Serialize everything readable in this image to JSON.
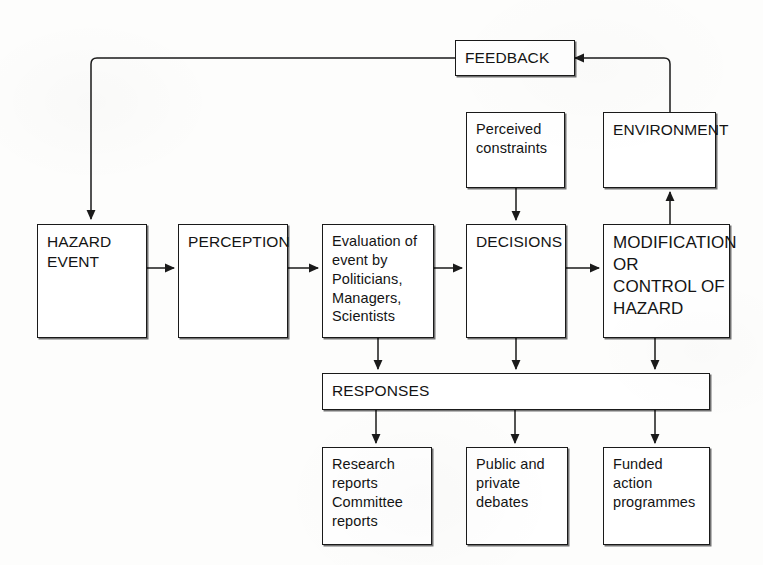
{
  "diagram": {
    "line_color": "#1a1a1a",
    "background_color": "#fdfdfc",
    "nodes": {
      "feedback": {
        "label": "FEEDBACK"
      },
      "environment": {
        "label": "ENVIRONMENT"
      },
      "constraints": {
        "label": "Perceived\nconstraints"
      },
      "hazard_event": {
        "label": "HAZARD\nEVENT"
      },
      "perception": {
        "label": "PERCEPTION"
      },
      "evaluation": {
        "label": "Evaluation of\nevent by\nPoliticians,\nManagers,\nScientists"
      },
      "decisions": {
        "label": "DECISIONS"
      },
      "modification": {
        "label": "MODIFICATION\nOR\nCONTROL OF\nHAZARD"
      },
      "responses": {
        "label": "RESPONSES"
      },
      "research": {
        "label": "Research\nreports\nCommittee\nreports"
      },
      "debates": {
        "label": "Public and\nprivate debates"
      },
      "funded": {
        "label": "Funded\naction\nprogrammes"
      }
    },
    "edges": [
      {
        "name": "hazard-to-perception",
        "from": "hazard_event",
        "to": "perception"
      },
      {
        "name": "perception-to-evaluation",
        "from": "perception",
        "to": "evaluation"
      },
      {
        "name": "evaluation-to-decisions",
        "from": "evaluation",
        "to": "decisions"
      },
      {
        "name": "decisions-to-modification",
        "from": "decisions",
        "to": "modification"
      },
      {
        "name": "constraints-to-decisions",
        "from": "constraints",
        "to": "decisions"
      },
      {
        "name": "modification-to-environment",
        "from": "modification",
        "to": "environment"
      },
      {
        "name": "environment-to-feedback",
        "from": "environment",
        "to": "feedback"
      },
      {
        "name": "feedback-to-hazard",
        "from": "feedback",
        "to": "hazard_event"
      },
      {
        "name": "evaluation-to-responses",
        "from": "evaluation",
        "to": "responses"
      },
      {
        "name": "decisions-to-responses",
        "from": "decisions",
        "to": "responses"
      },
      {
        "name": "modification-to-responses",
        "from": "modification",
        "to": "responses"
      },
      {
        "name": "responses-to-research",
        "from": "responses",
        "to": "research"
      },
      {
        "name": "responses-to-debates",
        "from": "responses",
        "to": "debates"
      },
      {
        "name": "responses-to-funded",
        "from": "responses",
        "to": "funded"
      }
    ]
  }
}
